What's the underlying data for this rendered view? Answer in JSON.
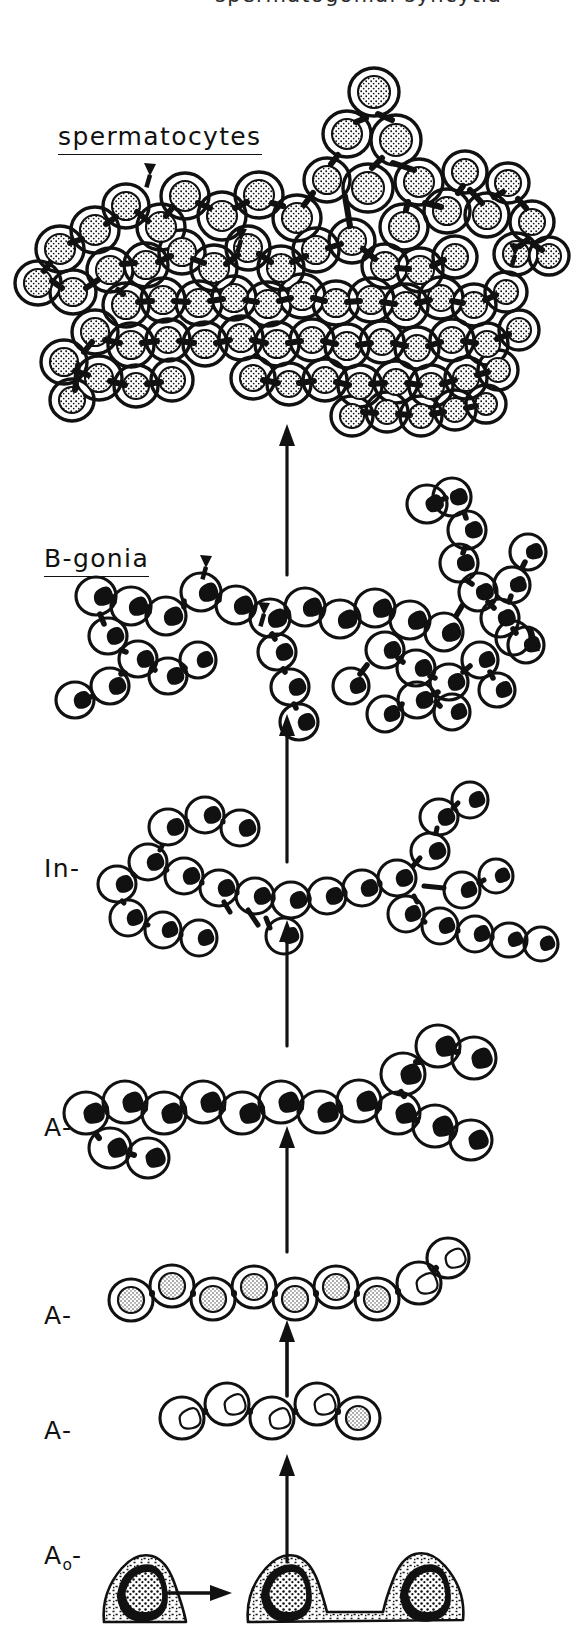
{
  "figure": {
    "width": 587,
    "height": 1644,
    "background_color": "#ffffff",
    "ink_color": "#111111",
    "cropped_top_text": "spermatogonial syncytia"
  },
  "labels": {
    "spermatocytes": "spermatocytes",
    "b_gonia": "B-gonia",
    "intermediate": "In-",
    "a_type_1": "A-",
    "a_type_2": "A-",
    "a_type_3": "A-",
    "a_zero": "A",
    "a_zero_subscript": "o",
    "a_zero_dash": "-"
  },
  "stages": [
    {
      "id": "spermatocytes",
      "label": "spermatocytes",
      "underlined": true,
      "row_top": 60,
      "row_bottom": 430,
      "cell_count": 84,
      "cell_kind": "round-granular-nucleus",
      "description": "Large branched syncytial cluster of spermatocytes with stippled round nuclei",
      "arrowheads": 3
    },
    {
      "id": "b-gonia",
      "label": "B-gonia",
      "underlined": true,
      "row_top": 480,
      "row_bottom": 760,
      "cell_count": 40,
      "cell_kind": "irregular-dark-nucleus",
      "description": "Long branching chain of B spermatogonia with irregular dark nuclei",
      "arrowheads": 3
    },
    {
      "id": "intermediate",
      "label": "In-",
      "underlined": false,
      "row_top": 800,
      "row_bottom": 980,
      "cell_count": 26,
      "cell_kind": "irregular-nucleus",
      "description": "Intermediate spermatogonia chain, branched",
      "arrowheads": 0
    },
    {
      "id": "a-type-1",
      "label": "A-",
      "underlined": false,
      "row_top": 1040,
      "row_bottom": 1180,
      "cell_count": 16,
      "cell_kind": "lobed-nucleus",
      "description": "A spermatogonia chain of 16 with lobed nuclei",
      "arrowheads": 0
    },
    {
      "id": "a-type-2",
      "label": "A-",
      "underlined": false,
      "row_top": 1240,
      "row_bottom": 1330,
      "cell_count": 8,
      "cell_kind": "speckled-nucleus",
      "description": "A spermatogonia chain of 8",
      "arrowheads": 0
    },
    {
      "id": "a-type-3",
      "label": "A-",
      "underlined": false,
      "row_top": 1370,
      "row_bottom": 1470,
      "cell_count": 4,
      "cell_kind": "speckled-nucleus",
      "description": "A spermatogonia chain of 4",
      "arrowheads": 0
    },
    {
      "id": "a-zero",
      "label": "A o -",
      "underlined": false,
      "row_top": 1540,
      "row_bottom": 1640,
      "cell_count": 3,
      "cell_kind": "dense-dark-nucleus-flat",
      "description": "A-zero reserve stem cell dividing into a pair of connected cells",
      "arrowheads": 0
    }
  ],
  "arrows": {
    "vertical": [
      {
        "name": "bgonia-to-spermatocytes",
        "x": 287,
        "from_y": 575,
        "to_y": 425,
        "length": 150
      },
      {
        "name": "in-to-bgonia",
        "x": 287,
        "from_y": 865,
        "to_y": 715,
        "length": 150
      },
      {
        "name": "a1-to-in",
        "x": 287,
        "from_y": 1045,
        "to_y": 920,
        "length": 125
      },
      {
        "name": "a2-to-a1",
        "x": 287,
        "from_y": 1252,
        "to_y": 1125,
        "length": 127
      },
      {
        "name": "a3-to-a2",
        "x": 287,
        "from_y": 1395,
        "to_y": 1320,
        "length": 75
      },
      {
        "name": "a0-to-a3",
        "x": 287,
        "from_y": 1560,
        "to_y": 1455,
        "length": 105
      }
    ],
    "horizontal": [
      {
        "name": "a0-self-renewal",
        "from_x": 168,
        "to_x": 228,
        "y": 1593
      }
    ],
    "direction": "up",
    "color": "#111111"
  },
  "arrowheads_markers": [
    {
      "name": "spermatocyte-marker-left",
      "x": 150,
      "y": 192
    },
    {
      "name": "spermatocyte-marker-mid",
      "x": 241,
      "y": 257
    },
    {
      "name": "spermatocyte-marker-right",
      "x": 514,
      "y": 272
    },
    {
      "name": "bgonia-marker-left",
      "x": 206,
      "y": 584
    },
    {
      "name": "bgonia-marker-mid",
      "x": 264,
      "y": 631
    },
    {
      "name": "bgonia-marker-right",
      "x": 533,
      "y": 655
    }
  ]
}
